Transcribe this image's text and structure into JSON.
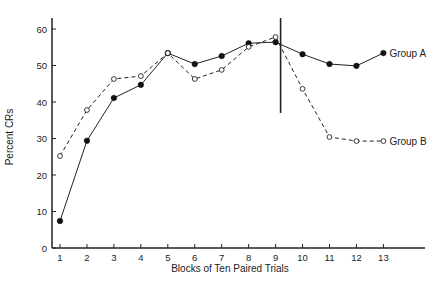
{
  "chart_data": {
    "type": "line",
    "title": "",
    "xlabel": "Blocks of Ten Paired Trials",
    "ylabel": "Percent CRs",
    "x": [
      1,
      2,
      3,
      4,
      5,
      6,
      7,
      8,
      9,
      10,
      11,
      12,
      13
    ],
    "xticks": [
      "1",
      "2",
      "3",
      "4",
      "5",
      "6",
      "7",
      "8",
      "9",
      "10",
      "11",
      "12",
      "13"
    ],
    "yticks": [
      "0",
      "10",
      "20",
      "30",
      "40",
      "50",
      "60"
    ],
    "ytick_values": [
      0,
      10,
      20,
      30,
      40,
      50,
      60
    ],
    "xlim": [
      0.7,
      14.5
    ],
    "ylim": [
      0,
      63
    ],
    "grid": false,
    "series": [
      {
        "name": "Group A",
        "style": "solid",
        "marker": "filled-circle",
        "values": [
          7.4,
          29.4,
          41.1,
          44.7,
          53.4,
          50.4,
          52.6,
          56.1,
          56.4,
          53.1,
          50.4,
          49.9,
          53.4
        ]
      },
      {
        "name": "Group B",
        "style": "dashed",
        "marker": "open-circle",
        "values": [
          25.2,
          37.8,
          46.3,
          47.1,
          53.4,
          46.3,
          48.8,
          55.1,
          57.8,
          43.6,
          30.4,
          29.3,
          29.3
        ]
      }
    ],
    "annotations": [
      {
        "type": "vertical-line",
        "x": 9,
        "y_from": 37,
        "y_to": 63
      }
    ],
    "legend": "inline-right"
  }
}
